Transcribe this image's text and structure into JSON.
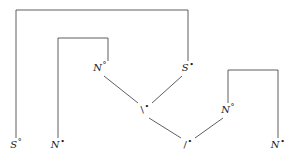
{
  "figure": {
    "kind": "proof-net-diagram",
    "width": 295,
    "height": 164,
    "background_color": "#ffffff",
    "line_color": "#4d4d4d",
    "text_color": "#1a1a1a"
  },
  "nodes": {
    "leaf_s_neg": {
      "atom": "S",
      "polarity": "°",
      "x": 16,
      "y": 145
    },
    "leaf_n_pos_left": {
      "atom": "N",
      "polarity": "•",
      "x": 58,
      "y": 145
    },
    "leaf_slash_pos": {
      "atom": "/",
      "polarity": "•",
      "x": 188,
      "y": 145
    },
    "leaf_n_pos_right": {
      "atom": "N",
      "polarity": "•",
      "x": 278,
      "y": 145
    },
    "mid_n_neg_left": {
      "atom": "N",
      "polarity": "°",
      "x": 100,
      "y": 68
    },
    "mid_s_pos": {
      "atom": "S",
      "polarity": "•",
      "x": 188,
      "y": 68
    },
    "mid_backslash_pos": {
      "atom": "\\",
      "polarity": "•",
      "x": 145,
      "y": 110
    },
    "mid_n_neg_right": {
      "atom": "N",
      "polarity": "°",
      "x": 228,
      "y": 110
    }
  },
  "axiom_links": [
    {
      "name": "outer-axiom-link",
      "x1": 16,
      "x2": 188,
      "top": 10,
      "y1": 138,
      "y2": 61
    },
    {
      "name": "inner-axiom-link",
      "x1": 58,
      "x2": 108,
      "top": 38,
      "y1": 138,
      "y2": 61
    },
    {
      "name": "right-axiom-link",
      "x1": 228,
      "x2": 278,
      "top": 70,
      "y1": 103,
      "y2": 138
    }
  ],
  "tensor_edges": [
    {
      "name": "edge-n-neg-left-to-backslash",
      "x1": 104,
      "y1": 76,
      "x2": 138,
      "y2": 103
    },
    {
      "name": "edge-s-pos-to-backslash",
      "x1": 182,
      "y1": 76,
      "x2": 152,
      "y2": 103
    },
    {
      "name": "edge-backslash-to-slash",
      "x1": 149,
      "y1": 118,
      "x2": 181,
      "y2": 138
    },
    {
      "name": "edge-n-neg-right-to-slash",
      "x1": 223,
      "y1": 118,
      "x2": 195,
      "y2": 138
    }
  ]
}
